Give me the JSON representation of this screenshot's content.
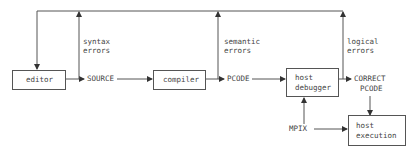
{
  "diagram": {
    "boxes": {
      "editor": "editor",
      "compiler": "compiler",
      "host_debugger_line1": "host",
      "host_debugger_line2": "debugger",
      "host_execution_line1": "host",
      "host_execution_line2": "execution"
    },
    "labels": {
      "source": "SOURCE",
      "pcode": "PCODE",
      "correct_pcode_line1": "CORRECT",
      "correct_pcode_line2": "PCODE",
      "mpix": "MPIX",
      "syntax_errors_line1": "syntax",
      "syntax_errors_line2": "errors",
      "semantic_errors_line1": "semantic",
      "semantic_errors_line2": "errors",
      "logical_errors_line1": "logical",
      "logical_errors_line2": "errors"
    },
    "colors": {
      "line": "#555555",
      "text": "#444444",
      "background": "#ffffff"
    }
  }
}
